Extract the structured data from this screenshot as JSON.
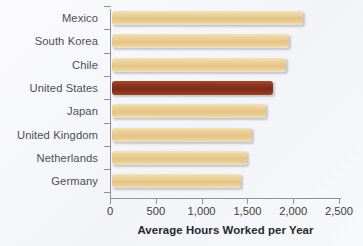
{
  "chart_data": {
    "type": "bar",
    "orientation": "horizontal",
    "title": "",
    "xlabel": "Average Hours Worked per Year",
    "ylabel": "",
    "categories": [
      "Mexico",
      "South Korea",
      "Chile",
      "United States",
      "Japan",
      "United Kingdom",
      "Netherlands",
      "Germany"
    ],
    "values": [
      2090,
      1930,
      1900,
      1760,
      1685,
      1530,
      1475,
      1410
    ],
    "xlim": [
      0,
      2500
    ],
    "xticks": [
      0,
      500,
      1000,
      1500,
      2000,
      2500
    ],
    "xtick_labels": [
      "0",
      "500",
      "1,000",
      "1,500",
      "2,000",
      "2,500"
    ],
    "grid": false,
    "legend": null,
    "highlight_category": "United States",
    "colors": {
      "bar_default": "#e4c486",
      "bar_highlight": "#8e3720",
      "axis": "#8e949d",
      "label_text": "#4b4f56",
      "title_text": "#25282d",
      "background": "#f6f7f9"
    },
    "series": [
      {
        "name": "Average Hours Worked per Year",
        "points": [
          {
            "category": "Mexico",
            "value": 2090,
            "highlighted": false
          },
          {
            "category": "South Korea",
            "value": 1930,
            "highlighted": false
          },
          {
            "category": "Chile",
            "value": 1900,
            "highlighted": false
          },
          {
            "category": "United States",
            "value": 1760,
            "highlighted": true
          },
          {
            "category": "Japan",
            "value": 1685,
            "highlighted": false
          },
          {
            "category": "United Kingdom",
            "value": 1530,
            "highlighted": false
          },
          {
            "category": "Netherlands",
            "value": 1475,
            "highlighted": false
          },
          {
            "category": "Germany",
            "value": 1410,
            "highlighted": false
          }
        ]
      }
    ]
  }
}
